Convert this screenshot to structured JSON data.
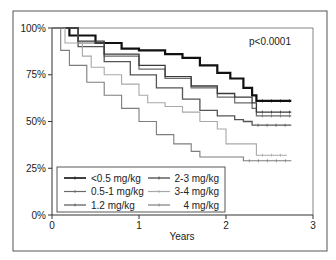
{
  "chart_data": {
    "type": "line",
    "subtype": "kaplan-meier step",
    "title": "",
    "xlabel": "Years",
    "ylabel": "",
    "xlim": [
      0,
      3
    ],
    "ylim": [
      0,
      100
    ],
    "x_ticks": [
      "0",
      "1",
      "2",
      "3"
    ],
    "y_ticks": [
      "0%",
      "25%",
      "50%",
      "75%",
      "100%"
    ],
    "grid": false,
    "annotation": "p<0.0001",
    "legend_position": "lower left (inside)",
    "series": [
      {
        "name": "<0.5 mg/kg",
        "color": "#111111",
        "width": 2.2,
        "x": [
          0,
          0.2,
          0.5,
          0.8,
          1.0,
          1.3,
          1.5,
          1.7,
          1.9,
          2.05,
          2.2,
          2.3,
          2.35,
          2.75
        ],
        "y": [
          100,
          96,
          92,
          89,
          88,
          86,
          84,
          80,
          76,
          73,
          68,
          64,
          61,
          61
        ]
      },
      {
        "name": "0.5-1 mg/kg",
        "color": "#6a6a6a",
        "width": 1.2,
        "x": [
          0,
          0.3,
          0.6,
          1.0,
          1.3,
          1.6,
          1.9,
          2.1,
          2.3,
          2.35,
          2.75
        ],
        "y": [
          100,
          92,
          85,
          78,
          73,
          68,
          63,
          60,
          57,
          53,
          53
        ]
      },
      {
        "name": "1.2 mg/kg",
        "color": "#555555",
        "width": 1.3,
        "x": [
          0,
          0.3,
          0.6,
          0.9,
          1.2,
          1.5,
          1.7,
          1.9,
          2.1,
          2.2,
          2.3,
          2.75
        ],
        "y": [
          100,
          90,
          82,
          75,
          68,
          62,
          56,
          53,
          51,
          50,
          48,
          48
        ]
      },
      {
        "name": "2-3 mg/kg",
        "color": "#3a3a3a",
        "width": 1.3,
        "x": [
          0,
          0.3,
          0.6,
          1.0,
          1.3,
          1.6,
          1.9,
          2.1,
          2.3,
          2.35,
          2.75
        ],
        "y": [
          100,
          93,
          86,
          80,
          74,
          69,
          65,
          63,
          60,
          55,
          55
        ]
      },
      {
        "name": "3-4 mg/kg",
        "color": "#a8a8a8",
        "width": 1.1,
        "x": [
          0,
          0.15,
          0.35,
          0.45,
          0.6,
          0.8,
          1.0,
          1.1,
          1.3,
          1.5,
          1.7,
          1.9,
          2.0,
          2.3,
          2.35,
          2.7
        ],
        "y": [
          100,
          92,
          85,
          79,
          75,
          70,
          64,
          60,
          58,
          55,
          50,
          46,
          38,
          38,
          32,
          32
        ]
      },
      {
        "name": "4 mg/kg",
        "color": "#7d7d7d",
        "width": 1.1,
        "x": [
          0,
          0.1,
          0.2,
          0.4,
          0.6,
          0.8,
          1.0,
          1.2,
          1.4,
          1.6,
          1.7,
          2.0,
          2.2,
          2.75
        ],
        "y": [
          100,
          88,
          80,
          71,
          64,
          57,
          50,
          43,
          38,
          34,
          31,
          31,
          29,
          29
        ]
      }
    ]
  },
  "legend": {
    "items": [
      {
        "label": "<0.5 mg/kg",
        "color": "#111111"
      },
      {
        "label": "2-3 mg/kg",
        "color": "#3a3a3a"
      },
      {
        "label": "0.5-1 mg/kg",
        "color": "#6a6a6a"
      },
      {
        "label": "3-4 mg/kg",
        "color": "#a8a8a8"
      },
      {
        "label": "1.2 mg/kg",
        "color": "#555555"
      },
      {
        "label": "4 mg/kg",
        "color": "#7d7d7d"
      }
    ]
  }
}
